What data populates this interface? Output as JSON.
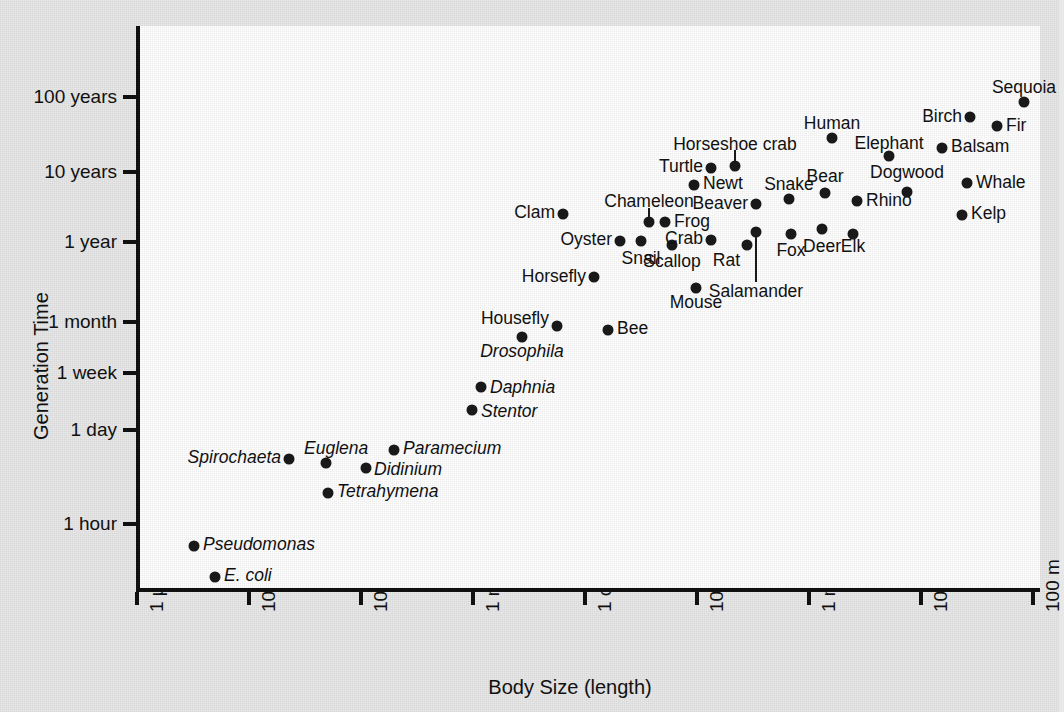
{
  "chart_data": {
    "type": "scatter",
    "title": "",
    "xlabel": "Body Size (length)",
    "ylabel": "Generation Time",
    "grid": false,
    "legend": "none",
    "xticks": [
      "1 µm",
      "10 µm",
      "100 µm",
      "1 mm",
      "1 cm",
      "10 cm",
      "1 m",
      "10 m",
      "100 m"
    ],
    "yticks": [
      "100 years",
      "10 years",
      "1 year",
      "1 month",
      "1 week",
      "1 day",
      "1 hour"
    ],
    "xlim_log10_m": [
      -6,
      2
    ],
    "ylim_note": "logarithmic generation time, ~1 hour to ~100 years",
    "points": [
      {
        "label": "E. coli",
        "italic": true,
        "px": 211,
        "py": 577,
        "lx": 220,
        "ly": 576,
        "anchor": "l"
      },
      {
        "label": "Pseudomonas",
        "italic": true,
        "px": 190,
        "py": 546,
        "lx": 199,
        "ly": 545,
        "anchor": "l"
      },
      {
        "label": "Tetrahymena",
        "italic": true,
        "px": 324,
        "py": 493,
        "lx": 333,
        "ly": 492,
        "anchor": "l"
      },
      {
        "label": "Didinium",
        "italic": true,
        "px": 362,
        "py": 468,
        "lx": 370,
        "ly": 470,
        "anchor": "l"
      },
      {
        "label": "Spirochaeta",
        "italic": true,
        "px": 285,
        "py": 459,
        "lx": 277,
        "ly": 458,
        "anchor": "r"
      },
      {
        "label": "Euglena",
        "italic": true,
        "px": 322,
        "py": 463,
        "lx": 300,
        "ly": 449,
        "anchor": "l"
      },
      {
        "label": "Paramecium",
        "italic": true,
        "px": 390,
        "py": 450,
        "lx": 399,
        "ly": 449,
        "anchor": "l"
      },
      {
        "label": "Stentor",
        "italic": true,
        "px": 468,
        "py": 410,
        "lx": 477,
        "ly": 412,
        "anchor": "l"
      },
      {
        "label": "Daphnia",
        "italic": true,
        "px": 477,
        "py": 387,
        "lx": 486,
        "ly": 388,
        "anchor": "l"
      },
      {
        "label": "Drosophila",
        "italic": true,
        "px": 518,
        "py": 337,
        "lx": 518,
        "ly": 352,
        "anchor": "c"
      },
      {
        "label": "Housefly",
        "italic": false,
        "px": 553,
        "py": 326,
        "lx": 545,
        "ly": 319,
        "anchor": "r"
      },
      {
        "label": "Bee",
        "italic": false,
        "px": 604,
        "py": 330,
        "lx": 613,
        "ly": 329,
        "anchor": "l"
      },
      {
        "label": "Horsefly",
        "italic": false,
        "px": 590,
        "py": 277,
        "lx": 582,
        "ly": 277,
        "anchor": "r"
      },
      {
        "label": "Mouse",
        "italic": false,
        "px": 692,
        "py": 288,
        "lx": 692,
        "ly": 303,
        "anchor": "c"
      },
      {
        "label": "Clam",
        "italic": false,
        "px": 559,
        "py": 214,
        "lx": 551,
        "ly": 213,
        "anchor": "r"
      },
      {
        "label": "Oyster",
        "italic": false,
        "px": 616,
        "py": 241,
        "lx": 608,
        "ly": 240,
        "anchor": "r"
      },
      {
        "label": "Snail",
        "italic": false,
        "px": 637,
        "py": 241,
        "lx": 637,
        "ly": 259,
        "anchor": "c"
      },
      {
        "label": "Scallop",
        "italic": false,
        "px": 668,
        "py": 245,
        "lx": 668,
        "ly": 262,
        "anchor": "c"
      },
      {
        "label": "Chameleon",
        "italic": false,
        "px": 645,
        "py": 222,
        "lx": 645,
        "ly": 202,
        "anchor": "c",
        "leader": {
          "x": 645,
          "y0": 208,
          "y1": 220
        }
      },
      {
        "label": "Frog",
        "italic": false,
        "px": 661,
        "py": 222,
        "lx": 670,
        "ly": 222,
        "anchor": "l"
      },
      {
        "label": "Crab",
        "italic": false,
        "px": 707,
        "py": 240,
        "lx": 699,
        "ly": 239,
        "anchor": "r"
      },
      {
        "label": "Rat",
        "italic": false,
        "px": 743,
        "py": 245,
        "lx": 736,
        "ly": 261,
        "anchor": "r"
      },
      {
        "label": "Salamander",
        "italic": false,
        "px": 752,
        "py": 232,
        "lx": 752,
        "ly": 292,
        "anchor": "c",
        "leader": {
          "x": 752,
          "y0": 234,
          "y1": 282
        }
      },
      {
        "label": "Fox",
        "italic": false,
        "px": 787,
        "py": 234,
        "lx": 787,
        "ly": 251,
        "anchor": "c"
      },
      {
        "label": "Deer",
        "italic": false,
        "px": 818,
        "py": 229,
        "lx": 818,
        "ly": 247,
        "anchor": "c"
      },
      {
        "label": "Elk",
        "italic": false,
        "px": 849,
        "py": 234,
        "lx": 849,
        "ly": 247,
        "anchor": "c"
      },
      {
        "label": "Beaver",
        "italic": false,
        "px": 752,
        "py": 204,
        "lx": 744,
        "ly": 204,
        "anchor": "r"
      },
      {
        "label": "Snake",
        "italic": false,
        "px": 785,
        "py": 199,
        "lx": 785,
        "ly": 185,
        "anchor": "c"
      },
      {
        "label": "Bear",
        "italic": false,
        "px": 821,
        "py": 193,
        "lx": 821,
        "ly": 177,
        "anchor": "c"
      },
      {
        "label": "Rhino",
        "italic": false,
        "px": 853,
        "py": 201,
        "lx": 862,
        "ly": 201,
        "anchor": "l"
      },
      {
        "label": "Newt",
        "italic": false,
        "px": 690,
        "py": 185,
        "lx": 699,
        "ly": 184,
        "anchor": "l"
      },
      {
        "label": "Turtle",
        "italic": false,
        "px": 707,
        "py": 168,
        "lx": 699,
        "ly": 167,
        "anchor": "r"
      },
      {
        "label": "Horseshoe crab",
        "italic": false,
        "px": 731,
        "py": 166,
        "lx": 731,
        "ly": 145,
        "anchor": "c",
        "leader": {
          "x": 731,
          "y0": 150,
          "y1": 164
        }
      },
      {
        "label": "Human",
        "italic": false,
        "px": 828,
        "py": 138,
        "lx": 828,
        "ly": 124,
        "anchor": "c"
      },
      {
        "label": "Elephant",
        "italic": false,
        "px": 885,
        "py": 156,
        "lx": 885,
        "ly": 144,
        "anchor": "c"
      },
      {
        "label": "Dogwood",
        "italic": false,
        "px": 903,
        "py": 192,
        "lx": 903,
        "ly": 173,
        "anchor": "c"
      },
      {
        "label": "Balsam",
        "italic": false,
        "px": 938,
        "py": 148,
        "lx": 947,
        "ly": 147,
        "anchor": "l"
      },
      {
        "label": "Birch",
        "italic": false,
        "px": 966,
        "py": 117,
        "lx": 958,
        "ly": 117,
        "anchor": "r"
      },
      {
        "label": "Fir",
        "italic": false,
        "px": 993,
        "py": 126,
        "lx": 1002,
        "ly": 126,
        "anchor": "l"
      },
      {
        "label": "Sequoia",
        "italic": false,
        "px": 1020,
        "py": 102,
        "lx": 1020,
        "ly": 88,
        "anchor": "c"
      },
      {
        "label": "Whale",
        "italic": false,
        "px": 963,
        "py": 183,
        "lx": 972,
        "ly": 183,
        "anchor": "l"
      },
      {
        "label": "Kelp",
        "italic": false,
        "px": 958,
        "py": 215,
        "lx": 967,
        "ly": 214,
        "anchor": "l"
      }
    ],
    "ytick_positions": [
      97,
      172,
      242,
      322,
      373,
      430,
      524
    ],
    "xtick_positions": [
      137,
      249,
      361,
      473,
      585,
      697,
      809,
      921,
      1033
    ]
  }
}
